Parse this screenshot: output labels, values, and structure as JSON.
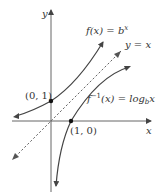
{
  "diagram": {
    "axes": {
      "x_label": "x",
      "y_label": "y"
    },
    "curves": [
      {
        "name": "exponential",
        "label_func": "f(x) = b",
        "label_exp": "x"
      },
      {
        "name": "logarithm",
        "label_func": "f",
        "label_sup": "−1",
        "label_rest": "(x) = log",
        "label_sub": "b",
        "label_arg": "x"
      },
      {
        "name": "identity",
        "label": "y = x"
      }
    ],
    "points": [
      {
        "label": "(0, 1)"
      },
      {
        "label": "(1, 0)"
      }
    ],
    "colors": {
      "curve": "#444444",
      "axis": "#555555",
      "dashed": "#666666"
    }
  }
}
